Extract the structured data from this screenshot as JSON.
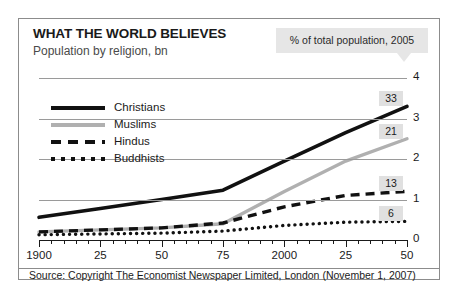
{
  "header": {
    "title": "WHAT THE WORLD BELIEVES",
    "subtitle": "Population by religion, bn",
    "callout": "% of total population, 2005"
  },
  "source": "Source: Copyright The Economist Newspaper Limited, London (November 1, 2007)",
  "legend": [
    {
      "label": "Christians",
      "style": "solid-black"
    },
    {
      "label": "Muslims",
      "style": "solid-gray"
    },
    {
      "label": "Hindus",
      "style": "dashed"
    },
    {
      "label": "Buddhists",
      "style": "dotted"
    }
  ],
  "axis": {
    "y_ticks": [
      "0",
      "1",
      "2",
      "3",
      "4"
    ],
    "x_ticks": [
      "1900",
      "25",
      "50",
      "75",
      "2000",
      "25",
      "50"
    ]
  },
  "end_labels": [
    {
      "series": "Christians",
      "value": "33"
    },
    {
      "series": "Muslims",
      "value": "21"
    },
    {
      "series": "Hindus",
      "value": "13"
    },
    {
      "series": "Buddhists",
      "value": "6"
    }
  ],
  "chart_data": {
    "type": "line",
    "title": "WHAT THE WORLD BELIEVES",
    "subtitle": "Population by religion, bn",
    "annotation": "% of total population, 2005",
    "xlabel": "",
    "ylabel": "Population by religion, bn",
    "xlim": [
      1900,
      2050
    ],
    "ylim": [
      0,
      4
    ],
    "grid": true,
    "legend_position": "upper-left",
    "x": [
      1900,
      1925,
      1950,
      1975,
      2000,
      2025,
      2050
    ],
    "series": [
      {
        "name": "Christians",
        "style": "solid",
        "color": "#111111",
        "end_label": "33",
        "values": [
          0.56,
          0.78,
          1.0,
          1.23,
          1.95,
          2.65,
          3.3
        ]
      },
      {
        "name": "Muslims",
        "style": "solid",
        "color": "#b0b0b0",
        "end_label": "21",
        "values": [
          0.2,
          0.25,
          0.3,
          0.4,
          1.2,
          1.95,
          2.5
        ]
      },
      {
        "name": "Hindus",
        "style": "dashed",
        "color": "#111111",
        "end_label": "13",
        "values": [
          0.2,
          0.25,
          0.3,
          0.42,
          0.82,
          1.1,
          1.2
        ]
      },
      {
        "name": "Buddhists",
        "style": "dotted",
        "color": "#111111",
        "end_label": "6",
        "values": [
          0.13,
          0.15,
          0.17,
          0.22,
          0.36,
          0.44,
          0.46
        ]
      }
    ]
  }
}
